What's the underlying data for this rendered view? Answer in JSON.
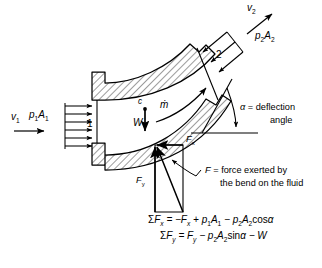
{
  "figure": {
    "kind": "pipe-bend-control-volume-free-body-diagram",
    "background": "#ffffff",
    "ink": "#000000",
    "hatch_color": "#3a3a3a"
  },
  "inlet": {
    "velocity_label": "v",
    "velocity_sub": "1",
    "pressure_force_label": "p",
    "pressure_force_sub1": "1",
    "pressure_force_label2": "A",
    "pressure_force_sub2": "1",
    "section_label": "1",
    "pressure_arrow_count": 6
  },
  "outlet": {
    "velocity_label": "v",
    "velocity_sub": "2",
    "pressure_force_label": "p",
    "pressure_force_sub1": "2",
    "pressure_force_label2": "A",
    "pressure_force_sub2": "2",
    "section_label": "2",
    "pressure_arrow_count": 3
  },
  "interior": {
    "centroid_label": "c",
    "weight_label": "W",
    "massflow_label": "ṁ"
  },
  "angle": {
    "symbol": "α",
    "equals": "=",
    "text_line1": "deflection",
    "text_line2": "angle"
  },
  "forces": {
    "fx_label": "F",
    "fx_sub": "x",
    "fy_label": "F",
    "fy_sub": "y",
    "resultant_label": "F",
    "resultant_equals": "=",
    "resultant_line1": "force exerted by",
    "resultant_line2": "the bend on the fluid"
  },
  "equations": {
    "sigma": "Σ",
    "eq1": {
      "lhs_base": "F",
      "lhs_sub": "x",
      "terms": "= −F",
      "t1_sub": "x",
      "t2": "+ p",
      "t2_sub": "1",
      "t2b": "A",
      "t2b_sub": "1",
      "t3": "− p",
      "t3_sub": "2",
      "t3b": "A",
      "t3b_sub": "2",
      "t3c": "cos",
      "t3d": "α"
    },
    "eq2": {
      "lhs_base": "F",
      "lhs_sub": "y",
      "terms": "= F",
      "t1_sub": "y",
      "t2": "− p",
      "t2_sub": "2",
      "t2b": "A",
      "t2b_sub": "2",
      "t2c": "sin",
      "t2d": "α",
      "t3": "− W"
    }
  }
}
